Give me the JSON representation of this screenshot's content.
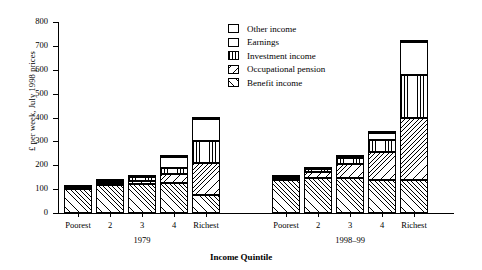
{
  "chart_data": {
    "type": "bar",
    "stacked": true,
    "title": "",
    "xlabel": "Income Quintile",
    "ylabel": "£ per week, July 1998 prices",
    "ylim": [
      0,
      800
    ],
    "ytick_step": 100,
    "yticks": [
      0,
      100,
      200,
      300,
      400,
      500,
      600,
      700,
      800
    ],
    "grid": false,
    "legend_position": "top-center-right",
    "categories": [
      "Poorest",
      "2",
      "3",
      "4",
      "Richest"
    ],
    "groups": [
      "1979",
      "1998–99"
    ],
    "series": [
      {
        "name": "Benefit income",
        "pattern": "diagonal-up-hatch",
        "values_1979": [
          100,
          118,
          120,
          125,
          75
        ],
        "values_1998_99": [
          137,
          148,
          145,
          140,
          137
        ]
      },
      {
        "name": "Occupational pension",
        "pattern": "diagonal-down-hatch",
        "values_1979": [
          3,
          6,
          15,
          40,
          135
        ],
        "values_1998_99": [
          5,
          22,
          60,
          115,
          260
        ]
      },
      {
        "name": "Investment income",
        "pattern": "vertical-line-hatch",
        "values_1979": [
          5,
          10,
          15,
          25,
          90
        ],
        "values_1998_99": [
          8,
          13,
          25,
          50,
          180
        ]
      },
      {
        "name": "Earnings",
        "pattern": "solid-white",
        "values_1979": [
          2,
          2,
          2,
          45,
          95
        ],
        "values_1998_99": [
          2,
          2,
          5,
          30,
          140
        ]
      },
      {
        "name": "Other income",
        "pattern": "solid-black",
        "values_1979": [
          2,
          2,
          2,
          2,
          2
        ],
        "values_1998_99": [
          2,
          2,
          2,
          2,
          6
        ]
      }
    ],
    "totals_1979": [
      112,
      138,
      154,
      237,
      397
    ],
    "totals_1998_99": [
      154,
      187,
      237,
      337,
      723
    ]
  },
  "axis": {
    "y_title": "£ per week, July 1998 prices",
    "x_title": "Income Quintile",
    "ytick_labels": [
      "800",
      "700",
      "600",
      "500",
      "400",
      "300",
      "200",
      "100",
      "0"
    ]
  },
  "groups": [
    {
      "name": "1979",
      "categories": [
        "Poorest",
        "2",
        "3",
        "4",
        "Richest"
      ]
    },
    {
      "name": "1998–99",
      "categories": [
        "Poorest",
        "2",
        "3",
        "4",
        "Richest"
      ]
    }
  ],
  "legend": {
    "items": [
      {
        "label": "Other income",
        "pattern": "solid-black"
      },
      {
        "label": "Earnings",
        "pattern": "solid-white"
      },
      {
        "label": "Investment income",
        "pattern": "vertical-line-hatch"
      },
      {
        "label": "Occupational pension",
        "pattern": "diagonal-down-hatch"
      },
      {
        "label": "Benefit income",
        "pattern": "diagonal-up-hatch"
      }
    ]
  }
}
